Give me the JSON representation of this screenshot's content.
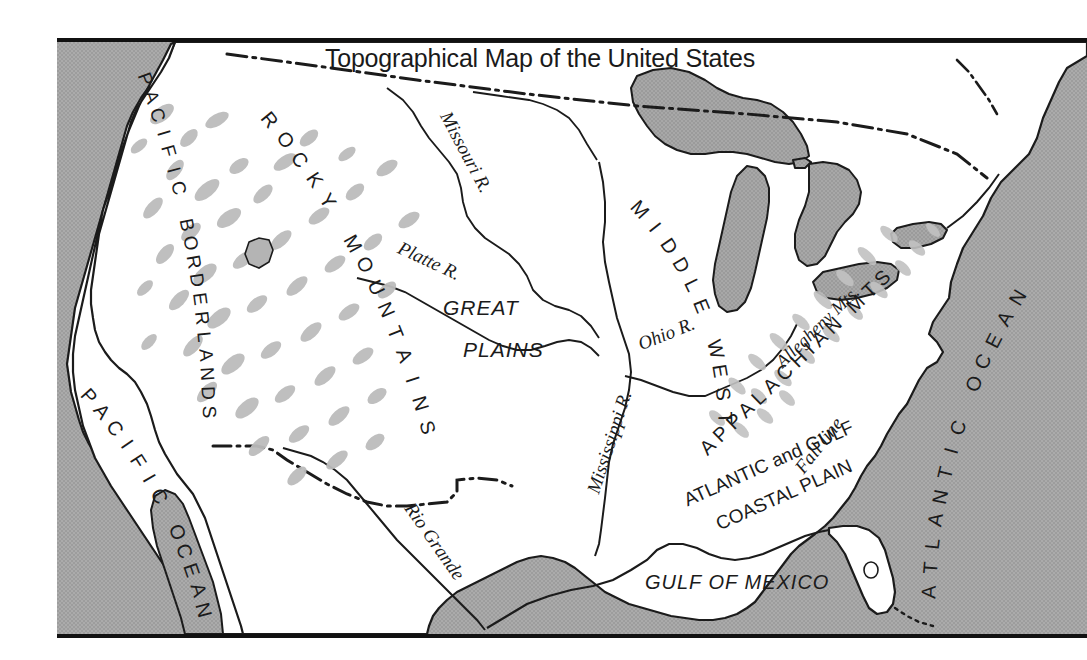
{
  "title": "Topographical Map of the United States",
  "colors": {
    "ocean": "#a9a9a9",
    "land": "#ffffff",
    "coastline": "#1b1b1b",
    "mountain_stipple": "#b9b9b9",
    "border_line": "#111111",
    "label_text": "#1b1b1b"
  },
  "labels": {
    "pacific_borderlands": "PACIFIC BORDERLANDS",
    "pacific_ocean": "PACIFIC OCEAN",
    "rocky_mountains": "ROCKY MOUNTAINS",
    "great_plains_line1": "GREAT",
    "great_plains_line2": "PLAINS",
    "missouri_river": "Missouri R.",
    "platte_river": "Platte R.",
    "mississippi_river": "Mississippi R.",
    "ohio_river": "Ohio R.",
    "rio_grande": "Rio Grande",
    "middle_west": "MIDDLE WEST",
    "allegheny_mts": "Allegheny Mts.",
    "appalachian_mts": "APPALACHIAN MTS",
    "fall_line": "Fall line",
    "coastal_plain_line1": "ATLANTIC and GULF",
    "coastal_plain_line2": "COASTAL PLAIN",
    "atlantic_ocean": "ATLANTIC OCEAN",
    "gulf_of_mexico": "GULF OF MEXICO"
  },
  "map_features": {
    "oceans": [
      "Pacific Ocean",
      "Atlantic Ocean",
      "Gulf of Mexico"
    ],
    "physiographic_regions": [
      "Pacific Borderlands",
      "Rocky Mountains",
      "Great Plains",
      "Middle West",
      "Appalachian Mts",
      "Atlantic and Gulf Coastal Plain"
    ],
    "rivers": [
      "Missouri R.",
      "Platte R.",
      "Mississippi R.",
      "Ohio R.",
      "Rio Grande"
    ],
    "named_ranges": [
      "Rocky Mountains",
      "Appalachian Mts",
      "Allegheny Mts."
    ],
    "boundary_style": "dash-dot",
    "great_lakes_count": 5
  }
}
